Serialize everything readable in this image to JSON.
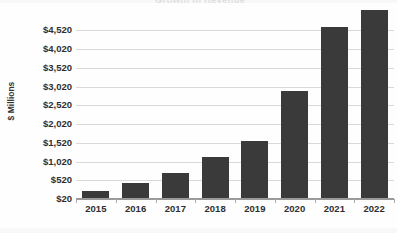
{
  "chart_data": {
    "type": "bar",
    "title": "Growth in Revenue",
    "xlabel": "",
    "ylabel": "$ Millions",
    "categories": [
      "2015",
      "2016",
      "2017",
      "2018",
      "2019",
      "2020",
      "2021",
      "2022"
    ],
    "values": [
      220,
      420,
      690,
      1120,
      1550,
      2890,
      4590,
      5050
    ],
    "ylim": [
      20,
      5120
    ],
    "ytick_values": [
      20,
      520,
      1020,
      1520,
      2020,
      2520,
      3020,
      3520,
      4020,
      4520
    ],
    "ytick_labels": [
      "$20",
      "$520",
      "$1,020",
      "$1,520",
      "$2,020",
      "$2,520",
      "$3,020",
      "$3,520",
      "$4,020",
      "$4,520"
    ],
    "grid": true,
    "legend": false,
    "bar_color": "#3a3a3a",
    "gridline_color": "#d9d9d9",
    "axis_color": "#9a9a9a",
    "background_color": "#fefefe"
  },
  "axes": {
    "y_title": "$ Millions"
  }
}
